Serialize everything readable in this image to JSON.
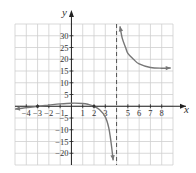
{
  "chart_data": {
    "type": "line",
    "title": "",
    "xlabel": "x",
    "ylabel": "y",
    "xlim": [
      -5,
      9
    ],
    "ylim": [
      -25,
      35
    ],
    "grid": true,
    "x_ticks": [
      "-4",
      "-3",
      "-2",
      "-1",
      "1",
      "2",
      "3",
      "5",
      "6",
      "7",
      "8"
    ],
    "y_ticks": [
      "30",
      "25",
      "20",
      "15",
      "10",
      "5",
      "-5",
      "-10",
      "-15",
      "-20"
    ],
    "vertical_asymptote": {
      "x": 4,
      "style": "dashed"
    },
    "horizontal_asymptote_approx": {
      "y": 16
    },
    "series": [
      {
        "name": "left branch",
        "points": [
          [
            -5,
            -1.2
          ],
          [
            -4,
            -0.6
          ],
          [
            -3,
            0
          ],
          [
            -2,
            0.5
          ],
          [
            -1,
            1
          ],
          [
            0,
            1.3
          ],
          [
            1,
            1.2
          ],
          [
            1.5,
            0.8
          ],
          [
            2,
            0
          ],
          [
            2.5,
            -1.5
          ],
          [
            3,
            -4.5
          ],
          [
            3.3,
            -9
          ],
          [
            3.5,
            -15
          ],
          [
            3.7,
            -23
          ]
        ]
      },
      {
        "name": "right branch",
        "points": [
          [
            4.3,
            34
          ],
          [
            4.5,
            29
          ],
          [
            4.8,
            25
          ],
          [
            5,
            22.5
          ],
          [
            5.5,
            20
          ],
          [
            6,
            18
          ],
          [
            7,
            16.5
          ],
          [
            8,
            16.2
          ],
          [
            8.8,
            16.3
          ]
        ]
      }
    ],
    "marked_points": [
      [
        -3,
        0
      ],
      [
        2,
        0
      ]
    ]
  },
  "labels": {
    "x_axis": "x",
    "y_axis": "y",
    "x_ticks": [
      {
        "v": -4,
        "t": "−4"
      },
      {
        "v": -3,
        "t": "−3"
      },
      {
        "v": -2,
        "t": "−2"
      },
      {
        "v": -1,
        "t": "−1"
      },
      {
        "v": 1,
        "t": "1"
      },
      {
        "v": 2,
        "t": "2"
      },
      {
        "v": 3,
        "t": "3"
      },
      {
        "v": 5,
        "t": "5"
      },
      {
        "v": 6,
        "t": "6"
      },
      {
        "v": 7,
        "t": "7"
      },
      {
        "v": 8,
        "t": "8"
      }
    ],
    "y_ticks": [
      {
        "v": 30,
        "t": "30"
      },
      {
        "v": 25,
        "t": "25"
      },
      {
        "v": 20,
        "t": "20"
      },
      {
        "v": 15,
        "t": "15"
      },
      {
        "v": 10,
        "t": "10"
      },
      {
        "v": 5,
        "t": "5"
      },
      {
        "v": -5,
        "t": "−5"
      },
      {
        "v": -10,
        "t": "−10"
      },
      {
        "v": -15,
        "t": "−15"
      },
      {
        "v": -20,
        "t": "−20"
      }
    ]
  },
  "colors": {
    "curve": "#777777",
    "grid": "#cfcfcf",
    "axis": "#222222"
  }
}
